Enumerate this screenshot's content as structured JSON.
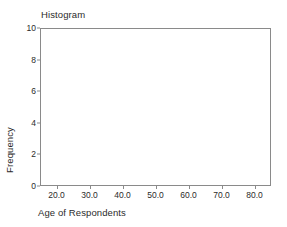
{
  "chart_data": {
    "type": "bar",
    "title": "Histogram",
    "subtitle": "",
    "xlabel": "Age of Respondents",
    "ylabel": "Frequency",
    "xlim": [
      15,
      85
    ],
    "ylim": [
      0,
      10
    ],
    "grid": false,
    "legend": null,
    "x_ticks": [
      "20.0",
      "30.0",
      "40.0",
      "50.0",
      "60.0",
      "70.0",
      "80.0"
    ],
    "x_tick_values": [
      20,
      30,
      40,
      50,
      60,
      70,
      80
    ],
    "y_ticks": [
      "0",
      "2",
      "4",
      "6",
      "8",
      "10"
    ],
    "y_tick_values": [
      0,
      2,
      4,
      6,
      8,
      10
    ],
    "categories": [],
    "values": [],
    "annotations": []
  },
  "style": {
    "axis_color": "#8a8a8a",
    "text_color": "#2b2b2b",
    "background": "#ffffff",
    "bar_fill": "#9a9a9a"
  }
}
